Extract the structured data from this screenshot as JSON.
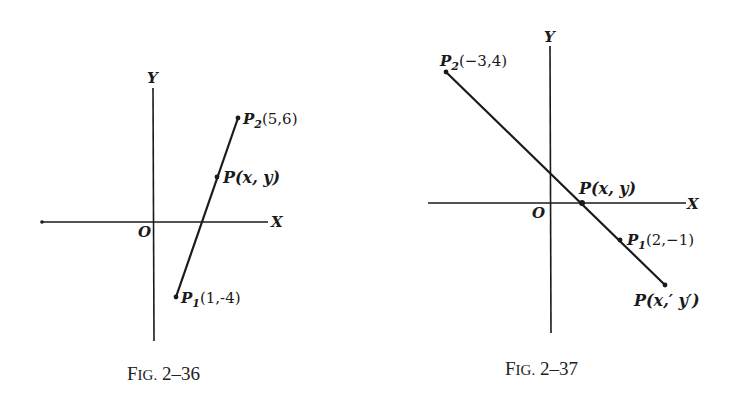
{
  "figures": [
    {
      "id": "fig-2-36",
      "caption": {
        "prefix": "F",
        "smallcaps": "IG.",
        "number": " 2–36"
      },
      "axes": {
        "x_label": "X",
        "y_label": "Y",
        "origin_label": "O"
      },
      "points": [
        {
          "name": "P2",
          "base": "P",
          "sub": "2",
          "coords": "(5,6)"
        },
        {
          "name": "P",
          "base": "P",
          "sub": "",
          "coords": "(x, y)"
        },
        {
          "name": "P1",
          "base": "P",
          "sub": "1",
          "coords": "(1,-4)"
        }
      ]
    },
    {
      "id": "fig-2-37",
      "caption": {
        "prefix": "F",
        "smallcaps": "IG.",
        "number": " 2–37"
      },
      "axes": {
        "x_label": "X",
        "y_label": "Y",
        "origin_label": "O"
      },
      "points": [
        {
          "name": "P2",
          "base": "P",
          "sub": "2",
          "coords": "(−3,4)"
        },
        {
          "name": "P",
          "base": "P",
          "sub": "",
          "coords": "(x, y)"
        },
        {
          "name": "P1",
          "base": "P",
          "sub": "1",
          "coords": "(2,−1)"
        },
        {
          "name": "P'",
          "base": "P",
          "sub": "",
          "coords": "(x,′ y′)"
        }
      ]
    }
  ]
}
